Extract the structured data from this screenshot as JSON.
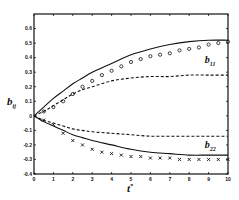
{
  "chart_data": {
    "type": "line",
    "title": "",
    "xlabel": "t*",
    "ylabel": "b_ij",
    "xlim": [
      0,
      10
    ],
    "ylim": [
      -0.4,
      0.7
    ],
    "xticks": [
      0,
      1,
      2,
      3,
      4,
      5,
      6,
      7,
      8,
      9,
      10
    ],
    "yticks": [
      -0.4,
      -0.3,
      -0.2,
      -0.1,
      0,
      0.1,
      0.2,
      0.3,
      0.4,
      0.5,
      0.6
    ],
    "ytick_labels": [
      "-0.4",
      "-0.3",
      "-0.2",
      "-0.1",
      "0",
      "0.1",
      "0.2",
      "0.3",
      "0.4",
      "0.5",
      "0.6"
    ],
    "grid": false,
    "legend": null,
    "annotations": [
      {
        "text": "b",
        "sub": "11",
        "x": 8.8,
        "y": 0.36
      },
      {
        "text": "b",
        "sub": "22",
        "x": 8.8,
        "y": -0.22
      }
    ],
    "series": [
      {
        "name": "b11 solid",
        "style": "solid",
        "marker": "none",
        "x": [
          0,
          0.5,
          1,
          1.5,
          2,
          2.5,
          3,
          4,
          5,
          6,
          7,
          8,
          9,
          10
        ],
        "values": [
          0,
          0.06,
          0.12,
          0.17,
          0.22,
          0.26,
          0.3,
          0.36,
          0.42,
          0.46,
          0.49,
          0.51,
          0.52,
          0.52
        ]
      },
      {
        "name": "b11 dashed",
        "style": "dashed",
        "marker": "none",
        "x": [
          0,
          0.5,
          1,
          1.5,
          2,
          2.5,
          3,
          4,
          5,
          6,
          7,
          8,
          9,
          10
        ],
        "values": [
          0,
          0.03,
          0.07,
          0.11,
          0.15,
          0.18,
          0.2,
          0.24,
          0.26,
          0.27,
          0.27,
          0.28,
          0.28,
          0.28
        ]
      },
      {
        "name": "b11 circles",
        "style": "none",
        "marker": "circle",
        "x": [
          0.5,
          1,
          1.5,
          2,
          2.5,
          3,
          3.5,
          4,
          4.5,
          5,
          5.5,
          6,
          6.5,
          7,
          7.5,
          8,
          8.5,
          9,
          9.5,
          10
        ],
        "values": [
          0.03,
          0.06,
          0.1,
          0.15,
          0.2,
          0.24,
          0.28,
          0.31,
          0.34,
          0.37,
          0.39,
          0.41,
          0.42,
          0.43,
          0.45,
          0.46,
          0.47,
          0.49,
          0.5,
          0.51
        ]
      },
      {
        "name": "b22 dashed",
        "style": "dashed",
        "marker": "none",
        "x": [
          0,
          0.5,
          1,
          1.5,
          2,
          2.5,
          3,
          4,
          5,
          6,
          7,
          8,
          9,
          10
        ],
        "values": [
          0,
          -0.03,
          -0.05,
          -0.07,
          -0.09,
          -0.1,
          -0.11,
          -0.12,
          -0.13,
          -0.14,
          -0.14,
          -0.14,
          -0.14,
          -0.14
        ]
      },
      {
        "name": "b22 solid",
        "style": "solid",
        "marker": "none",
        "x": [
          0,
          0.5,
          1,
          1.5,
          2,
          2.5,
          3,
          4,
          5,
          6,
          7,
          8,
          9,
          10
        ],
        "values": [
          0,
          -0.04,
          -0.07,
          -0.1,
          -0.13,
          -0.15,
          -0.17,
          -0.2,
          -0.23,
          -0.25,
          -0.26,
          -0.27,
          -0.27,
          -0.27
        ]
      },
      {
        "name": "b22 crosses",
        "style": "none",
        "marker": "x",
        "x": [
          0.5,
          1,
          1.5,
          2,
          2.5,
          3,
          3.5,
          4,
          4.5,
          5,
          5.5,
          6,
          6.5,
          7,
          7.5,
          8,
          8.5,
          9,
          9.5,
          10
        ],
        "values": [
          -0.03,
          -0.06,
          -0.12,
          -0.17,
          -0.2,
          -0.23,
          -0.25,
          -0.26,
          -0.27,
          -0.28,
          -0.28,
          -0.29,
          -0.29,
          -0.29,
          -0.3,
          -0.3,
          -0.3,
          -0.3,
          -0.3,
          -0.3
        ]
      }
    ]
  }
}
